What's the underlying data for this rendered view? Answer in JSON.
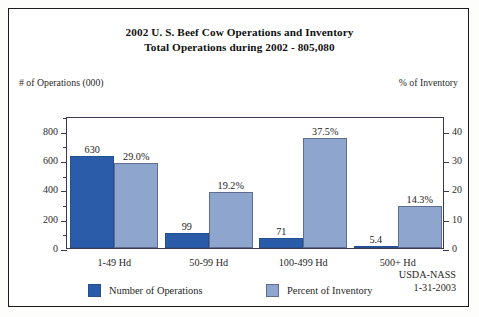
{
  "chart_data": {
    "type": "bar",
    "title": "2002 U. S. Beef Cow Operations and Inventory",
    "subtitle": "Total Operations during 2002 - 805,080",
    "categories": [
      "1-49 Hd",
      "50-99 Hd",
      "100-499 Hd",
      "500+ Hd"
    ],
    "series": [
      {
        "name": "Number of Operations",
        "color": "#2a5caa",
        "axis": "left",
        "values": [
          630,
          99,
          71,
          5.4
        ],
        "value_labels": [
          "630",
          "99",
          "71",
          "5.4"
        ]
      },
      {
        "name": "Percent of Inventory",
        "color": "#8ea5cd",
        "axis": "right",
        "values": [
          29.0,
          19.2,
          37.5,
          14.3
        ],
        "value_labels": [
          "29.0%",
          "19.2%",
          "37.5%",
          "14.3%"
        ]
      }
    ],
    "xlabel": "",
    "ylabel_left": "# of Operations (000)",
    "ylabel_right": "% of Inventory",
    "ylim_left": [
      0,
      900
    ],
    "ylim_right": [
      0,
      45
    ],
    "yticks_left": [
      "0",
      "200",
      "400",
      "600",
      "800"
    ],
    "yticks_left_values": [
      0,
      200,
      400,
      600,
      800
    ],
    "yticks_left_minor": [
      100,
      300,
      500,
      700,
      900
    ],
    "yticks_right": [
      "0",
      "10",
      "20",
      "30",
      "40"
    ],
    "yticks_right_values": [
      0,
      10,
      20,
      30,
      40
    ],
    "grid": false,
    "legend_position": "bottom"
  },
  "legend": [
    {
      "label": "Number of Operations",
      "swatch": "ops"
    },
    {
      "label": "Percent of Inventory",
      "swatch": "pct"
    }
  ],
  "source": {
    "agency": "USDA-NASS",
    "date": "1-31-2003"
  }
}
